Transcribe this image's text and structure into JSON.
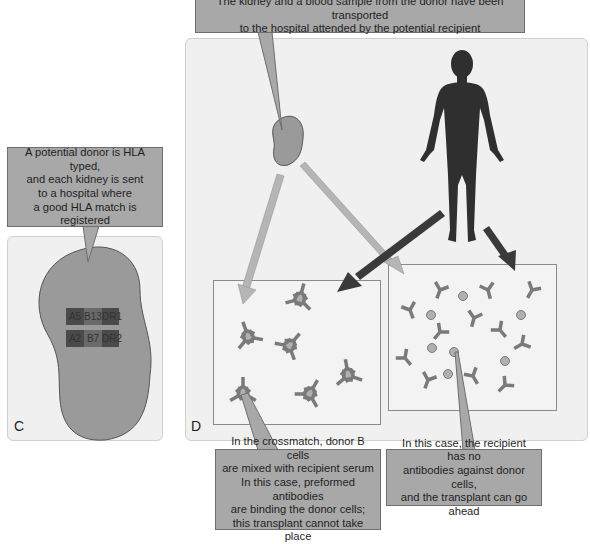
{
  "top_callout": {
    "lines": [
      "The kidney and a blood sample from the donor have been transported",
      "to the hospital attended by the potential recipient"
    ]
  },
  "left_callout": {
    "lines": [
      "A potential donor is HLA typed,",
      "and each kidney is sent",
      "to a hospital where",
      "a good HLA match is",
      "registered"
    ]
  },
  "panel_c": {
    "letter": "C",
    "hla_rows": [
      [
        "A5",
        "B13",
        "DR1"
      ],
      [
        "A2",
        "B7",
        "DR2"
      ]
    ]
  },
  "panel_d": {
    "letter": "D",
    "left_box": {
      "label": "crossmatch-positive"
    },
    "right_box": {
      "label": "crossmatch-negative"
    }
  },
  "bottom_left_callout": {
    "lines": [
      "In the crossmatch, donor B cells",
      "are mixed with recipient serum",
      "In this case, preformed antibodies",
      "are binding the donor cells;",
      "this transplant cannot take place"
    ]
  },
  "bottom_right_callout": {
    "lines": [
      "In this case, the recipient has no",
      "antibodies against donor cells,",
      "and the transplant can go ahead"
    ]
  },
  "colors": {
    "callout_fill": "#a8a8a8",
    "panel_bg": "#f0f0f0",
    "kidney_fill": "#9a9a9a",
    "human_fill": "#2f2f2f",
    "arrow_light": "#b5b5b5",
    "arrow_dark": "#3a3a3a",
    "antibody": "#7a7a7a",
    "cell": "#b0b0b0",
    "hla_dark": "#4a4a4a",
    "hla_mid": "#6a6a6a"
  }
}
